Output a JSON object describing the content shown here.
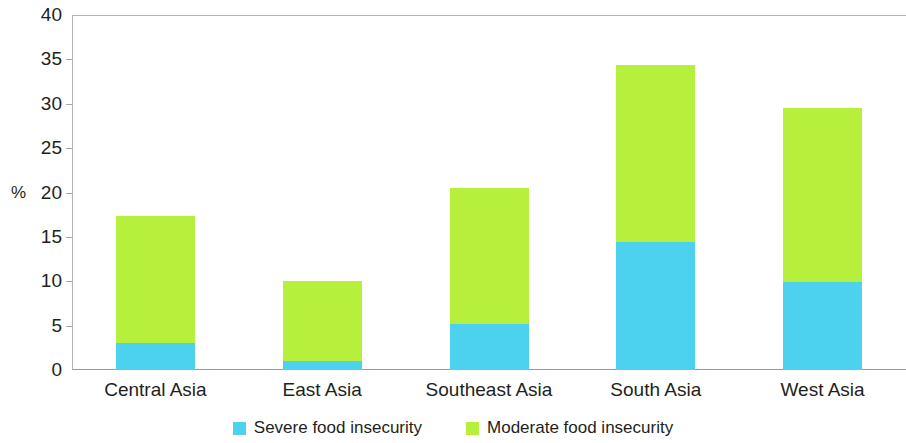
{
  "chart_data": {
    "type": "bar",
    "subtype": "stacked-vertical",
    "title": "",
    "subtitle": "",
    "xlabel": "",
    "ylabel": "%",
    "ylim": [
      0,
      40
    ],
    "ytick_interval": 5,
    "ytick_labels": [
      "40",
      "35",
      "30",
      "25",
      "20",
      "15",
      "10",
      "5",
      "0"
    ],
    "ytick_values": [
      40,
      35,
      30,
      25,
      20,
      15,
      10,
      5,
      0
    ],
    "grid": false,
    "legend_position": "bottom-center",
    "categories": [
      "Central Asia",
      "East Asia",
      "Southeast Asia",
      "South Asia",
      "West Asia"
    ],
    "series": [
      {
        "name": "Severe food insecurity",
        "color": "#4cd2ef",
        "values": [
          3.0,
          1.0,
          5.2,
          14.4,
          9.9
        ]
      },
      {
        "name": "Moderate food insecurity",
        "color": "#b7ef3d",
        "values": [
          14.3,
          9.0,
          15.3,
          20.0,
          19.6
        ]
      }
    ],
    "totals": [
      17.3,
      10.0,
      20.5,
      34.4,
      29.5
    ]
  },
  "legend": {
    "items": [
      {
        "label": "Severe food insecurity",
        "color": "#4cd2ef",
        "swatch": "legend-swatch-severe"
      },
      {
        "label": "Moderate food insecurity",
        "color": "#b7ef3d",
        "swatch": "legend-swatch-moderate"
      }
    ]
  },
  "axis": {
    "y_title": "%",
    "axis_line_color": "#b3b3b3"
  }
}
